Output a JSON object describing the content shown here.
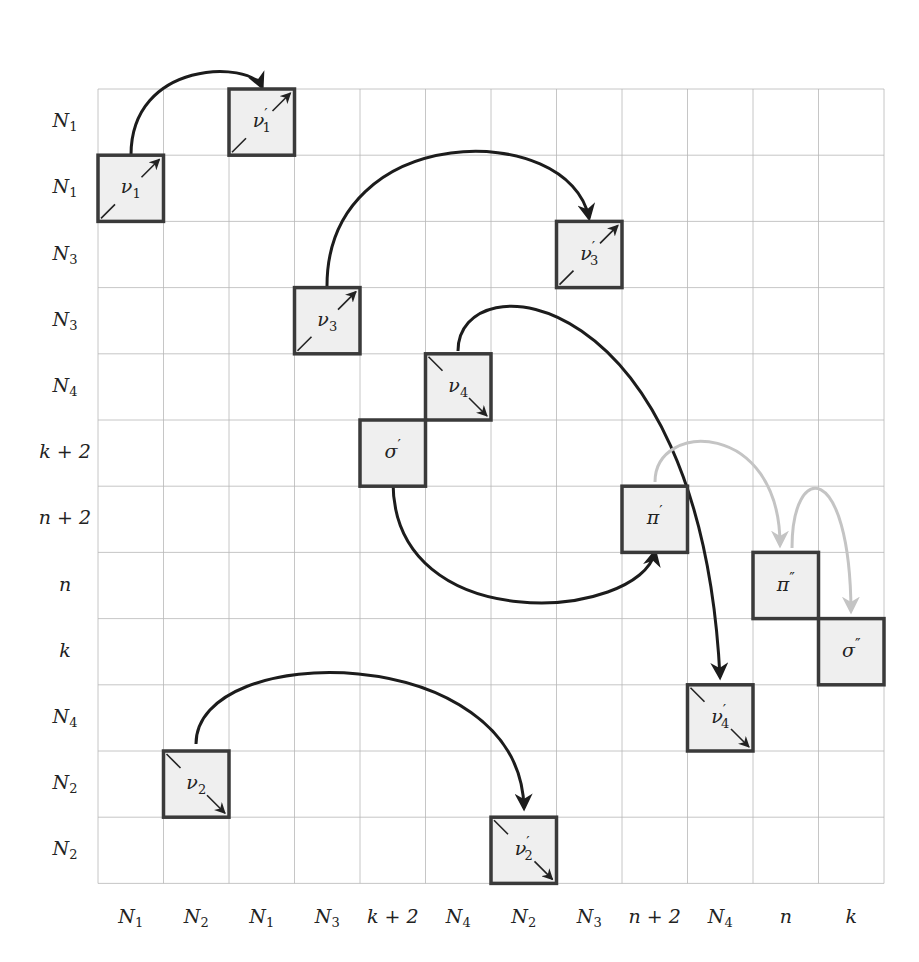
{
  "figure": {
    "grid": {
      "x0": 98,
      "y0": 89,
      "cell_w": 65.5,
      "cell_h": 66.2,
      "cols": 12,
      "rows": 12,
      "line_color": "#b8b8b8"
    },
    "row_labels": [
      {
        "base": "N",
        "sub": "1"
      },
      {
        "base": "N",
        "sub": "1"
      },
      {
        "base": "N",
        "sub": "3"
      },
      {
        "base": "N",
        "sub": "3"
      },
      {
        "base": "N",
        "sub": "4"
      },
      {
        "base": "k + 2",
        "sub": ""
      },
      {
        "base": "n + 2",
        "sub": ""
      },
      {
        "base": "n",
        "sub": ""
      },
      {
        "base": "k",
        "sub": ""
      },
      {
        "base": "N",
        "sub": "4"
      },
      {
        "base": "N",
        "sub": "2"
      },
      {
        "base": "N",
        "sub": "2"
      }
    ],
    "col_labels": [
      {
        "base": "N",
        "sub": "1"
      },
      {
        "base": "N",
        "sub": "2"
      },
      {
        "base": "N",
        "sub": "1"
      },
      {
        "base": "N",
        "sub": "3"
      },
      {
        "base": "k + 2",
        "sub": ""
      },
      {
        "base": "N",
        "sub": "4"
      },
      {
        "base": "N",
        "sub": "2"
      },
      {
        "base": "N",
        "sub": "3"
      },
      {
        "base": "n + 2",
        "sub": ""
      },
      {
        "base": "N",
        "sub": "4"
      },
      {
        "base": "n",
        "sub": ""
      },
      {
        "base": "k",
        "sub": ""
      }
    ],
    "boxes": [
      {
        "id": "nu1",
        "label": "ν",
        "sub": "1",
        "prime": "",
        "col": 0,
        "row": 1,
        "diag": "up"
      },
      {
        "id": "nu1prime",
        "label": "ν",
        "sub": "1",
        "prime": "′",
        "col": 2,
        "row": 0,
        "diag": "up"
      },
      {
        "id": "nu3",
        "label": "ν",
        "sub": "3",
        "prime": "",
        "col": 3,
        "row": 3,
        "diag": "up"
      },
      {
        "id": "nu3prime",
        "label": "ν",
        "sub": "3",
        "prime": "′",
        "col": 7,
        "row": 2,
        "diag": "up"
      },
      {
        "id": "nu4",
        "label": "ν",
        "sub": "4",
        "prime": "",
        "col": 5,
        "row": 4,
        "diag": "down"
      },
      {
        "id": "sigmaprime",
        "label": "σ",
        "sub": "",
        "prime": "′",
        "col": 4,
        "row": 5,
        "diag": "none"
      },
      {
        "id": "piprime",
        "label": "π",
        "sub": "",
        "prime": "′",
        "col": 8,
        "row": 6,
        "diag": "none"
      },
      {
        "id": "pi2prime",
        "label": "π",
        "sub": "",
        "prime": "″",
        "col": 10,
        "row": 7,
        "diag": "none"
      },
      {
        "id": "sigma2prime",
        "label": "σ",
        "sub": "",
        "prime": "″",
        "col": 11,
        "row": 8,
        "diag": "none"
      },
      {
        "id": "nu4prime",
        "label": "ν",
        "sub": "4",
        "prime": "′",
        "col": 9,
        "row": 9,
        "diag": "down"
      },
      {
        "id": "nu2",
        "label": "ν",
        "sub": "2",
        "prime": "",
        "col": 1,
        "row": 10,
        "diag": "down"
      },
      {
        "id": "nu2prime",
        "label": "ν",
        "sub": "2",
        "prime": "′",
        "col": 6,
        "row": 11,
        "diag": "down"
      }
    ],
    "arrows": [
      {
        "from": "nu1",
        "to": "nu1prime",
        "style": "dark",
        "path": "M131,155 C131,60 250,60 262,87"
      },
      {
        "from": "nu3",
        "to": "nu3prime",
        "style": "dark",
        "path": "M327,286 C327,120 570,120 589,218"
      },
      {
        "from": "nu4",
        "to": "nu4prime",
        "style": "dark",
        "path": "M458,351 C458,260 700,280 720,677"
      },
      {
        "from": "sigmaprime",
        "to": "piprime",
        "style": "dark",
        "path": "M393,482 C393,640 640,620 655,552"
      },
      {
        "from": "nu2",
        "to": "nu2prime",
        "style": "dark",
        "path": "M196,744 C196,640 520,640 524,808"
      },
      {
        "from": "piprime",
        "to": "pi2prime",
        "style": "light",
        "path": "M655,482 C655,420 780,420 780,545"
      },
      {
        "from": "pi2prime",
        "to": "sigma2prime",
        "style": "light",
        "path": "M792,548 C792,460 850,460 851,611"
      }
    ],
    "colors": {
      "box_fill": "#efefef",
      "box_stroke": "#3a3a3a",
      "arrow_dark": "#1c1c1c",
      "arrow_light": "#c4c4c4"
    }
  }
}
